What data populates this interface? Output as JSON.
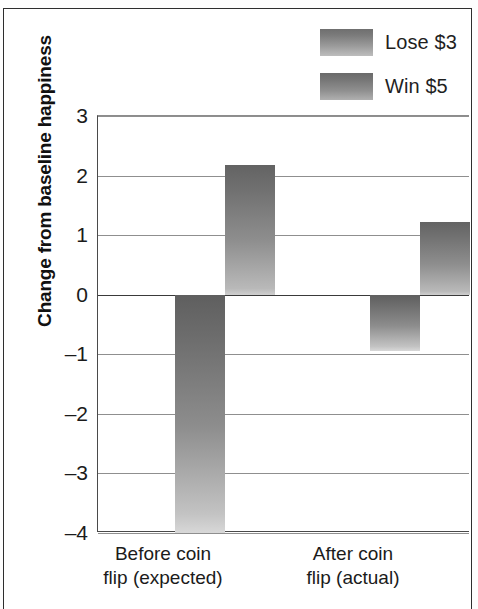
{
  "figure": {
    "background_color": "#ffffff",
    "frame_color": "#2e2e2e"
  },
  "legend": {
    "position": "top-right",
    "items": [
      {
        "label": "Lose $3",
        "swatch_name": "legend-swatch-lose",
        "color_top": "#6f6f6f",
        "color_bottom": "#bdbdbd"
      },
      {
        "label": "Win $5",
        "swatch_name": "legend-swatch-win",
        "color_top": "#6a6a6a",
        "color_bottom": "#b0b0b0"
      }
    ]
  },
  "axes": {
    "ylabel": "Change from baseline happiness",
    "yticks": [
      "3",
      "2",
      "1",
      "0",
      "–1",
      "–2",
      "–3",
      "–4"
    ],
    "xticks": [
      "Before coin\nflip (expected)",
      "After coin\nflip (actual)"
    ]
  },
  "chart_data": {
    "type": "bar",
    "title": "",
    "xlabel": "",
    "ylabel": "Change from baseline happiness",
    "categories": [
      "Before coin flip (expected)",
      "After coin flip (actual)"
    ],
    "series": [
      {
        "name": "Lose $3",
        "values": [
          -4.0,
          -0.95
        ]
      },
      {
        "name": "Win $5",
        "values": [
          2.17,
          1.22
        ]
      }
    ],
    "ylim": [
      -4,
      3
    ],
    "ytick_values": [
      3,
      2,
      1,
      0,
      -1,
      -2,
      -3,
      -4
    ],
    "grid": true,
    "grid_axis": "y",
    "legend_position": "upper right",
    "zero_line": true,
    "bar_style": "vertical-gradient-grayscale"
  }
}
